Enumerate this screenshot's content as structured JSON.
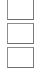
{
  "canvas": {
    "width": 49,
    "height": 72,
    "background_color": "#ffffff"
  },
  "boxes": {
    "count": 3,
    "border_color": "#8d8d8d",
    "fill_color": "#ffffff",
    "items": [
      {
        "index": 1,
        "label": "",
        "checked": false,
        "x": 7,
        "y": 0,
        "width": 27,
        "height": 20
      },
      {
        "index": 2,
        "label": "",
        "checked": false,
        "x": 7,
        "y": 23,
        "width": 27,
        "height": 20
      },
      {
        "index": 3,
        "label": "",
        "checked": false,
        "x": 7,
        "y": 47,
        "width": 27,
        "height": 20
      }
    ]
  }
}
